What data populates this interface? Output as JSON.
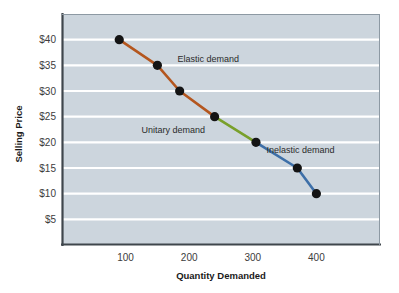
{
  "chart_data": {
    "type": "line",
    "title": "",
    "xlabel": "Quantity Demanded",
    "ylabel": "Selling Price",
    "xlim": [
      0,
      500
    ],
    "ylim": [
      0,
      45
    ],
    "grid": true,
    "legend": "none",
    "x": [
      90,
      150,
      185,
      240,
      305,
      370,
      400
    ],
    "y": [
      40,
      35,
      30,
      25,
      20,
      15,
      10
    ],
    "points": [
      {
        "x": 90,
        "y": 40
      },
      {
        "x": 150,
        "y": 35
      },
      {
        "x": 185,
        "y": 30
      },
      {
        "x": 240,
        "y": 25
      },
      {
        "x": 305,
        "y": 20
      },
      {
        "x": 370,
        "y": 15
      },
      {
        "x": 400,
        "y": 10
      }
    ],
    "series": [
      {
        "name": "Elastic demand",
        "color": "#b4561e",
        "points": [
          {
            "x": 90,
            "y": 40
          },
          {
            "x": 150,
            "y": 35
          },
          {
            "x": 185,
            "y": 30
          },
          {
            "x": 240,
            "y": 25
          }
        ]
      },
      {
        "name": "Unitary demand",
        "color": "#79a02b",
        "points": [
          {
            "x": 240,
            "y": 25
          },
          {
            "x": 305,
            "y": 20
          }
        ]
      },
      {
        "name": "Inelastic demand",
        "color": "#3d6fa8",
        "points": [
          {
            "x": 305,
            "y": 20
          },
          {
            "x": 370,
            "y": 15
          },
          {
            "x": 400,
            "y": 10
          }
        ]
      }
    ],
    "x_ticks": [
      {
        "value": 100,
        "label": "100"
      },
      {
        "value": 200,
        "label": "200"
      },
      {
        "value": 300,
        "label": "300"
      },
      {
        "value": 400,
        "label": "400"
      }
    ],
    "y_ticks": [
      {
        "value": 40,
        "label": "$40"
      },
      {
        "value": 35,
        "label": "$35"
      },
      {
        "value": 30,
        "label": "$30"
      },
      {
        "value": 25,
        "label": "$25"
      },
      {
        "value": 20,
        "label": "$20"
      },
      {
        "value": 15,
        "label": "$15"
      },
      {
        "value": 10,
        "label": "$10"
      },
      {
        "value": 5,
        "label": "$5"
      }
    ],
    "annotations": [
      {
        "text": "Elastic demand",
        "x": 230,
        "y": 36.2
      },
      {
        "text": "Unitary demand",
        "x": 175,
        "y": 22.4
      },
      {
        "text": "Inelastic demand",
        "x": 375,
        "y": 18.6
      }
    ],
    "colors": {
      "plot_background": "#ccd5dd",
      "gridline": "#ffffff",
      "axis": "#3f464c",
      "marker": "#141414",
      "elastic": "#b4561e",
      "unitary": "#79a02b",
      "inelastic": "#3d6fa8",
      "text": "#2b2b2b"
    }
  }
}
